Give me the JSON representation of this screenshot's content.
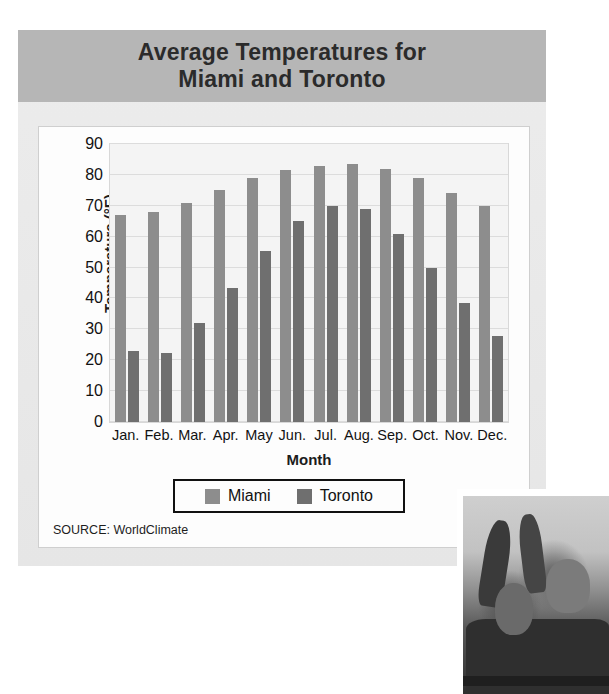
{
  "figure": {
    "title": "Average Temperatures for\nMiami and Toronto",
    "source_note": "SOURCE: WorldClimate"
  },
  "colors": {
    "miami": "#8d8d8d",
    "toronto": "#6f6f6f",
    "title_band": "#b6b6b6",
    "panel": "#e9e9e9",
    "plot_background": "#f4f4f4",
    "gridline": "#dcdcdc",
    "legend_border": "#111111"
  },
  "legend": {
    "entries": [
      {
        "label": "Miami",
        "color": "#8d8d8d"
      },
      {
        "label": "Toronto",
        "color": "#6f6f6f"
      }
    ]
  },
  "axes": {
    "y_title": "Temperature (°F)",
    "x_title": "Month",
    "y_ticks": [
      "90",
      "80",
      "70",
      "60",
      "50",
      "40",
      "30",
      "20",
      "10",
      "0"
    ]
  },
  "photo": {
    "caption": "children-cheering-photo"
  },
  "chart_data": {
    "type": "bar",
    "title": "Average Temperatures for Miami and Toronto",
    "xlabel": "Month",
    "ylabel": "Temperature (°F)",
    "ylim": [
      0,
      90
    ],
    "y_tick_step": 10,
    "grid": true,
    "legend_position": "bottom",
    "categories": [
      "Jan.",
      "Feb.",
      "Mar.",
      "Apr.",
      "May",
      "Jun.",
      "Jul.",
      "Aug.",
      "Sep.",
      "Oct.",
      "Nov.",
      "Dec."
    ],
    "series": [
      {
        "name": "Miami",
        "color": "#8d8d8d",
        "values": [
          67,
          68,
          71,
          75,
          79,
          81.5,
          83,
          83.5,
          82,
          79,
          74,
          70
        ]
      },
      {
        "name": "Toronto",
        "color": "#6f6f6f",
        "values": [
          23,
          22.5,
          32,
          43.5,
          55.5,
          65,
          70,
          69,
          61,
          50,
          38.5,
          28
        ]
      }
    ]
  }
}
